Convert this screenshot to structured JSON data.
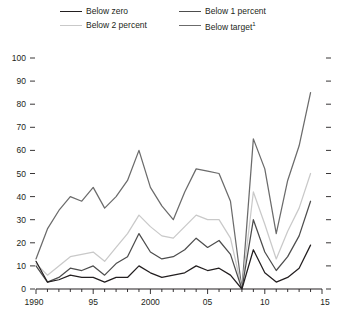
{
  "legend": {
    "items": [
      {
        "label": "Below zero",
        "color": "#231f20",
        "key": "below_zero"
      },
      {
        "label": "Below 1 percent",
        "color": "#4d4d4d",
        "key": "below_1"
      },
      {
        "label": "Below 2 percent",
        "color": "#c9c9c9",
        "key": "below_2"
      },
      {
        "label": "Below target",
        "color": "#6b6b6b",
        "key": "below_target",
        "footnote": "1"
      }
    ]
  },
  "axes": {
    "y_ticks": [
      "0",
      "10",
      "20",
      "30",
      "40",
      "50",
      "60",
      "70",
      "80",
      "90",
      "100"
    ],
    "x_ticks": [
      "1990",
      "95",
      "2000",
      "05",
      "10",
      "15"
    ]
  },
  "chart_data": {
    "type": "line",
    "title": "",
    "xlabel": "",
    "ylabel": "",
    "xlim": [
      1990,
      2015
    ],
    "ylim": [
      0,
      100
    ],
    "y_ticks": [
      0,
      10,
      20,
      30,
      40,
      50,
      60,
      70,
      80,
      90,
      100
    ],
    "x_tick_values": [
      1990,
      1995,
      2000,
      2005,
      2010,
      2015
    ],
    "x_tick_labels": [
      "1990",
      "95",
      "2000",
      "05",
      "10",
      "15"
    ],
    "x_minor_tick_step": 1,
    "grid": false,
    "legend_position": "top",
    "x": [
      1990,
      1991,
      1992,
      1993,
      1994,
      1995,
      1996,
      1997,
      1998,
      1999,
      2000,
      2001,
      2002,
      2003,
      2004,
      2005,
      2006,
      2007,
      2008,
      2009,
      2010,
      2011,
      2012,
      2013,
      2014
    ],
    "series": [
      {
        "name": "Below target",
        "color": "#6b6b6b",
        "values": [
          13,
          26,
          34,
          40,
          38,
          44,
          35,
          40,
          47,
          60,
          44,
          36,
          30,
          42,
          52,
          51,
          50,
          38,
          0,
          65,
          52,
          24,
          47,
          62,
          85
        ]
      },
      {
        "name": "Below 2 percent",
        "color": "#c9c9c9",
        "values": [
          11,
          6,
          10,
          14,
          15,
          16,
          12,
          18,
          24,
          32,
          27,
          23,
          22,
          27,
          32,
          30,
          30,
          22,
          0,
          42,
          28,
          13,
          25,
          35,
          50
        ]
      },
      {
        "name": "Below 1 percent",
        "color": "#4d4d4d",
        "values": [
          10,
          3,
          5,
          9,
          8,
          10,
          6,
          11,
          14,
          24,
          16,
          13,
          14,
          17,
          22,
          18,
          21,
          15,
          0,
          30,
          16,
          8,
          14,
          23,
          38
        ]
      },
      {
        "name": "Below zero",
        "color": "#231f20",
        "values": [
          12,
          3,
          4,
          6,
          5,
          5,
          3,
          5,
          5,
          10,
          7,
          5,
          6,
          7,
          10,
          8,
          9,
          6,
          0,
          17,
          7,
          3,
          5,
          9,
          19
        ]
      }
    ]
  }
}
